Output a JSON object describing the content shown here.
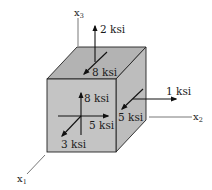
{
  "diagram": {
    "type": "stress-element-cube",
    "colors": {
      "front_face": "#c4c4c4",
      "top_face": "#b3b3b3",
      "right_face": "#bdbdbd",
      "edge": "#222222",
      "arrow": "#111111",
      "axis": "#555555"
    },
    "axes": {
      "x1": {
        "label": "x",
        "subscript": "1"
      },
      "x2": {
        "label": "x",
        "subscript": "2"
      },
      "x3": {
        "label": "x",
        "subscript": "3"
      }
    },
    "stresses": {
      "top_normal": "2 ksi",
      "top_shear": "8 ksi",
      "front_vertical": "8 ksi",
      "front_horizontal": "5 ksi",
      "front_normal": "3 ksi",
      "right_normal": "1 ksi",
      "right_shear": "5 ksi"
    }
  }
}
